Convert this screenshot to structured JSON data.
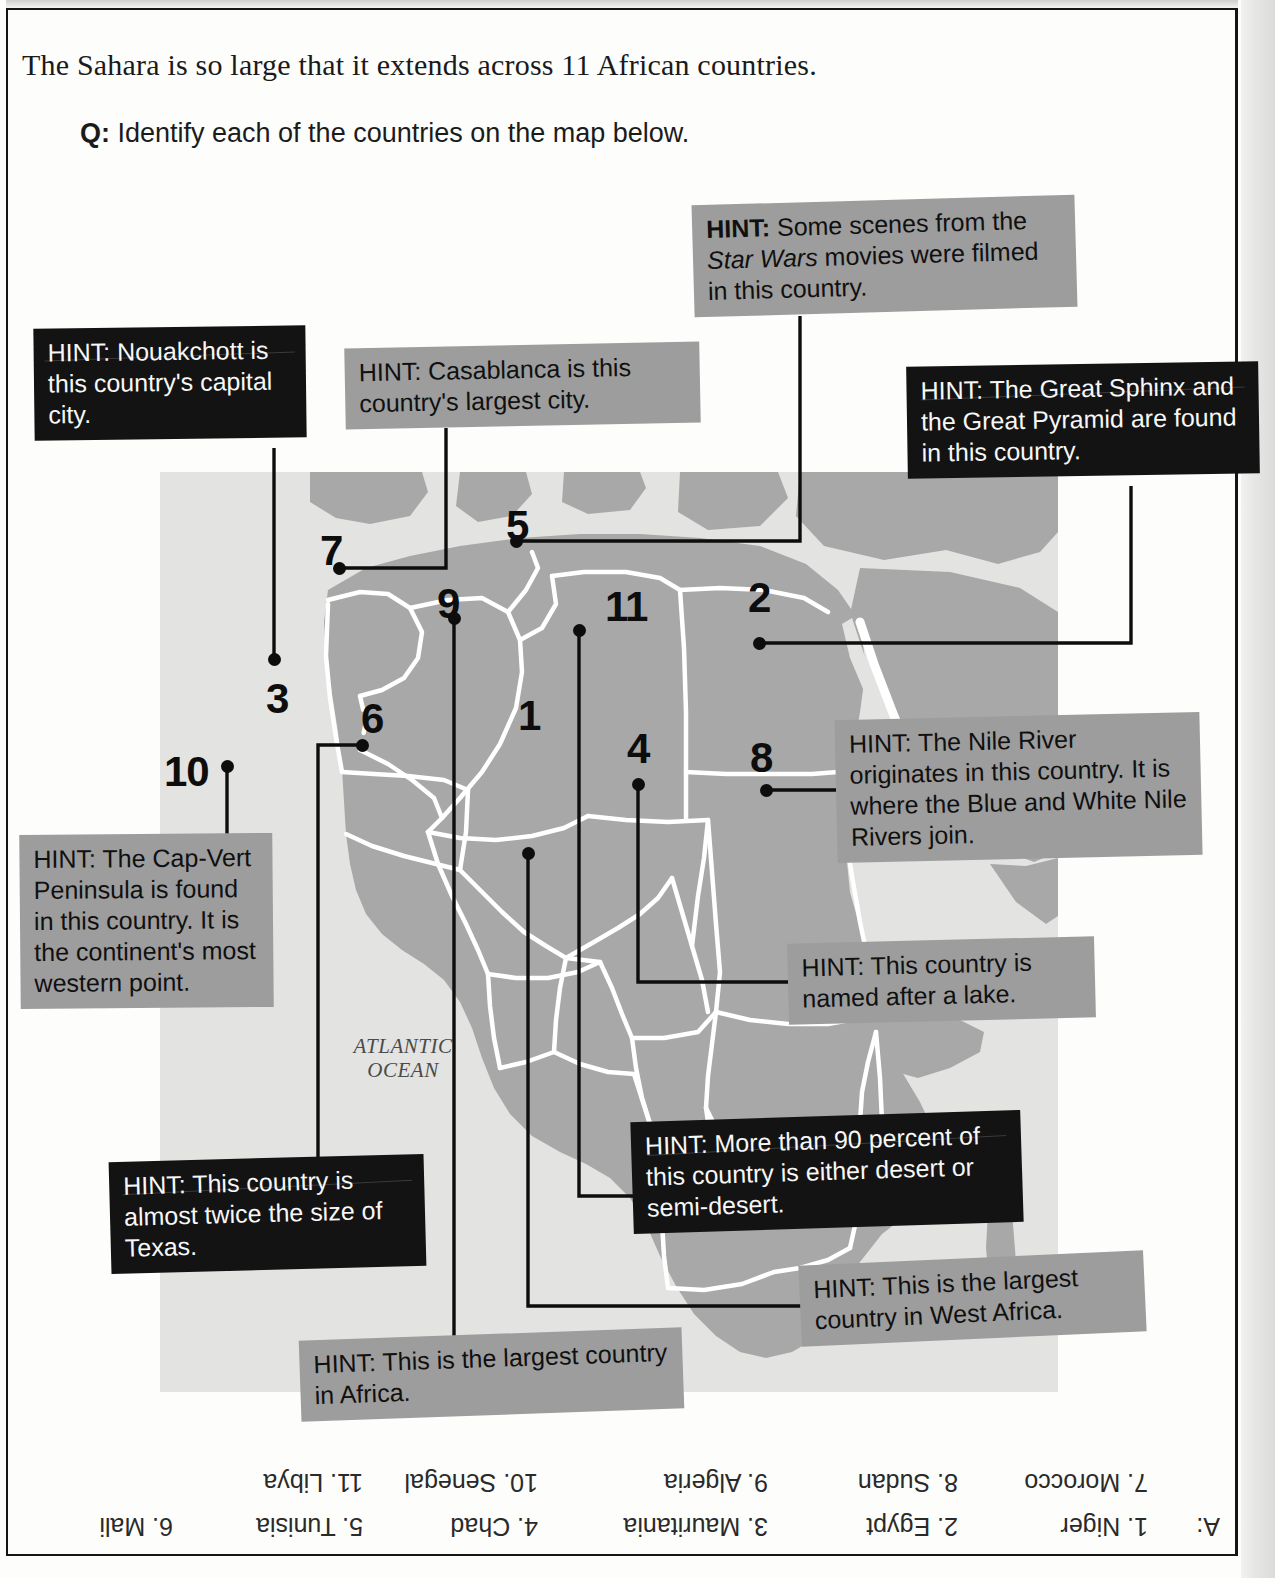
{
  "page": {
    "headline": "The Sahara is so large that it extends across 11 African countries.",
    "question_label": "Q:",
    "question_text": " Identify each of the countries on the map below.",
    "ocean_label_line1": "ATLANTIC",
    "ocean_label_line2": "OCEAN"
  },
  "colors": {
    "hint_dark_bg": "#131313",
    "hint_dark_text": "#f7f7f7",
    "hint_light_bg": "#9d9d9d",
    "hint_light_text": "#101010",
    "map_land": "#a8a8a8",
    "map_ocean": "#e3e3e1",
    "map_border": "#ffffff",
    "marker": "#0d0d0d"
  },
  "hint_prefix": "HINT:",
  "hints": [
    {
      "id": "hint-star-wars",
      "style": "light",
      "target_number": "5",
      "text_runs": [
        {
          "t": "HINT:",
          "bold": true
        },
        {
          "t": " Some scenes from the ",
          "bold": false
        },
        {
          "t": "Star Wars",
          "italic": true
        },
        {
          "t": " movies were filmed in this country.",
          "bold": false
        }
      ],
      "plain": "HINT: Some scenes from the Star Wars movies were filmed in this country."
    },
    {
      "id": "hint-nouakchott",
      "style": "dark",
      "target_number": "3",
      "plain": "HINT: Nouakchott is this country's capital city.",
      "text_runs": [
        {
          "t": "HINT:",
          "bold": true
        },
        {
          "t": " Nouakchott is this country’s capital city.",
          "bold": false
        }
      ]
    },
    {
      "id": "hint-casablanca",
      "style": "light",
      "target_number": "7",
      "plain": "HINT: Casablanca is this country's largest city.",
      "text_runs": [
        {
          "t": "HINT:",
          "bold": true
        },
        {
          "t": " Casablanca is this country’s largest city.",
          "bold": false
        }
      ]
    },
    {
      "id": "hint-sphinx",
      "style": "dark",
      "target_number": "2",
      "plain": "HINT: The Great Sphinx and the Great Pyramid are found in this country.",
      "text_runs": [
        {
          "t": "HINT:",
          "bold": true
        },
        {
          "t": " The Great Sphinx and the Great Pyramid are found in this country.",
          "bold": false
        }
      ]
    },
    {
      "id": "hint-nile",
      "style": "light",
      "target_number": "8",
      "plain": "HINT: The Nile River originates in this country. It is where the Blue and White Nile Rivers join.",
      "text_runs": [
        {
          "t": "HINT:",
          "bold": true
        },
        {
          "t": " The Nile River originates in this country. It is where the Blue and White Nile Rivers join.",
          "bold": false
        }
      ]
    },
    {
      "id": "hint-cap-vert",
      "style": "light",
      "target_number": "10",
      "plain": "HINT: The Cap-Vert Peninsula is found in this country. It is the continent's most western point.",
      "text_runs": [
        {
          "t": "HINT:",
          "bold": true
        },
        {
          "t": " The Cap-Vert Peninsula is found in this country. It is the continent’s most western point.",
          "bold": false
        }
      ]
    },
    {
      "id": "hint-named-after-lake",
      "style": "light",
      "target_number": "4",
      "plain": "HINT: This country is named after a lake.",
      "text_runs": [
        {
          "t": "HINT:",
          "bold": true
        },
        {
          "t": " This country is named after a lake.",
          "bold": false
        }
      ]
    },
    {
      "id": "hint-twice-texas",
      "style": "dark",
      "target_number": "6",
      "plain": "HINT: This country is almost twice the size of Texas.",
      "text_runs": [
        {
          "t": "HINT:",
          "bold": true
        },
        {
          "t": " This country is almost twice the size of Texas.",
          "bold": false
        }
      ]
    },
    {
      "id": "hint-90-percent-desert",
      "style": "dark",
      "target_number": "11",
      "plain": "HINT: More than 90 percent of this country is either desert or semi-desert.",
      "text_runs": [
        {
          "t": "HINT:",
          "bold": true
        },
        {
          "t": " More than 90 percent of this country is either desert or semi-desert.",
          "bold": false
        }
      ]
    },
    {
      "id": "hint-largest-west-africa",
      "style": "light",
      "target_number": "1",
      "plain": "HINT: This is the largest country in West Africa.",
      "text_runs": [
        {
          "t": "HINT:",
          "bold": true
        },
        {
          "t": " This is the largest country in West Africa.",
          "bold": false
        }
      ]
    },
    {
      "id": "hint-largest-africa",
      "style": "light",
      "target_number": "9",
      "plain": "HINT: This is the largest country in Africa.",
      "text_runs": [
        {
          "t": "HINT:",
          "bold": true
        },
        {
          "t": " This is the largest country in Africa.",
          "bold": false
        }
      ]
    }
  ],
  "map_markers": [
    {
      "n": "1",
      "num_x": 518,
      "num_y": 695,
      "dot_x": 528,
      "dot_y": 853
    },
    {
      "n": "2",
      "num_x": 748,
      "num_y": 577,
      "dot_x": 759,
      "dot_y": 643
    },
    {
      "n": "3",
      "num_x": 266,
      "num_y": 678,
      "dot_x": 274,
      "dot_y": 659
    },
    {
      "n": "4",
      "num_x": 627,
      "num_y": 728,
      "dot_x": 638,
      "dot_y": 784
    },
    {
      "n": "5",
      "num_x": 506,
      "num_y": 505,
      "dot_x": 516,
      "dot_y": 541
    },
    {
      "n": "6",
      "num_x": 361,
      "num_y": 698,
      "dot_x": 362,
      "dot_y": 745
    },
    {
      "n": "7",
      "num_x": 320,
      "num_y": 530,
      "dot_x": 339,
      "dot_y": 568
    },
    {
      "n": "8",
      "num_x": 750,
      "num_y": 737,
      "dot_x": 766,
      "dot_y": 790
    },
    {
      "n": "9",
      "num_x": 437,
      "num_y": 583,
      "dot_x": 454,
      "dot_y": 618
    },
    {
      "n": "10",
      "num_x": 164,
      "num_y": 751,
      "dot_x": 227,
      "dot_y": 766
    },
    {
      "n": "11",
      "num_x": 605,
      "num_y": 586,
      "dot_x": 579,
      "dot_y": 630
    }
  ],
  "answer_key": {
    "prefix": "A:",
    "row_top": [
      {
        "num": "11.",
        "name": "Libya"
      },
      {
        "num": "10.",
        "name": "Senegal"
      },
      {
        "num": "9.",
        "name": "Algeria"
      },
      {
        "num": "8.",
        "name": "Sudan"
      },
      {
        "num": "7.",
        "name": "Morocco"
      }
    ],
    "row_bottom": [
      {
        "num": "6.",
        "name": "Mali"
      },
      {
        "num": "5.",
        "name": "Tunisia"
      },
      {
        "num": "4.",
        "name": "Chad"
      },
      {
        "num": "3.",
        "name": "Mauritania"
      },
      {
        "num": "2.",
        "name": "Egypt"
      },
      {
        "num": "1.",
        "name": "Niger"
      }
    ],
    "full_text": "A: 1. Niger  2. Egypt  3. Mauritania  4. Chad  5. Tunisia  6. Mali  7. Morocco  8. Sudan  9. Algeria  10. Senegal  11. Libya"
  }
}
